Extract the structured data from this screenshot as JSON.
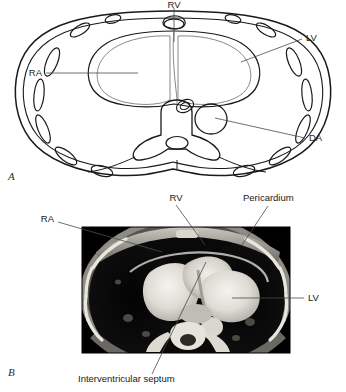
{
  "figure": {
    "panels": [
      {
        "id": "A",
        "letter": "A",
        "type": "line-diagram",
        "caption": "",
        "labels": [
          {
            "key": "rv",
            "text": "RV",
            "meaning": "right ventricle",
            "position": "top-center"
          },
          {
            "key": "lv",
            "text": "LV",
            "meaning": "left ventricle",
            "position": "right-upper"
          },
          {
            "key": "ra",
            "text": "RA",
            "meaning": "right atrium",
            "position": "left-middle"
          },
          {
            "key": "da",
            "text": "DA",
            "meaning": "descending aorta",
            "position": "right-lower"
          }
        ]
      },
      {
        "id": "B",
        "letter": "B",
        "type": "ct-scan",
        "caption": "Interventricular septum",
        "labels": [
          {
            "key": "rv",
            "text": "RV",
            "meaning": "right ventricle",
            "position": "top-center"
          },
          {
            "key": "pericardium",
            "text": "Pericardium",
            "meaning": "pericardium",
            "position": "top-right"
          },
          {
            "key": "ra",
            "text": "RA",
            "meaning": "right atrium",
            "position": "left-upper"
          },
          {
            "key": "lv",
            "text": "LV",
            "meaning": "left ventricle",
            "position": "right-middle"
          },
          {
            "key": "septum",
            "text": "Interventricular septum",
            "meaning": "interventricular septum",
            "position": "bottom-center"
          }
        ]
      }
    ],
    "colors": {
      "background": "#ffffff",
      "ink": "#1a1a1a",
      "leader": "#4a4a4a",
      "ct_dark": "#000000",
      "ct_bright": "#f2f2ee"
    }
  }
}
